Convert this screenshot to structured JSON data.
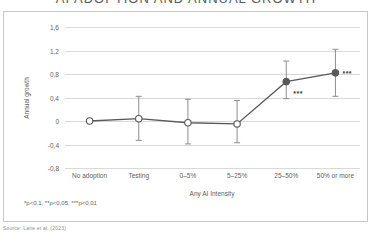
{
  "title": {
    "text": "AI ADOPTION AND ANNUAL GROWTH",
    "note": "cropped at top edge of screenshot"
  },
  "attribution": {
    "text": "Source: Lane et al. (2023)"
  },
  "footnote": {
    "text": "*p<0,1, **p<0,05, ***p<0,01"
  },
  "axes": {
    "ylabel": "Annual growth",
    "xlabel": "Any AI Intensity",
    "yticks": [
      "1,6",
      "1,2",
      "0,8",
      "0,4",
      "0",
      "-0,4",
      "-0,8"
    ]
  },
  "colors": {
    "line": "#595959",
    "marker_filled": "#595959",
    "marker_hollow": "#ffffff",
    "marker_stroke": "#595959",
    "errorbar": "#8c8c8c",
    "gridline": "#d9d9d9",
    "panel_border": "#c8c8c8",
    "text": "#5f5f5f",
    "background": "#ffffff"
  },
  "chart_data": {
    "type": "line",
    "title": "AI ADOPTION AND ANNUAL GROWTH",
    "xlabel": "Any AI Intensity",
    "ylabel": "Annual growth",
    "categories": [
      "No adoption",
      "Testing",
      "0–5%",
      "5–25%",
      "25–50%",
      "50% or more"
    ],
    "values": [
      0.0,
      0.04,
      -0.03,
      -0.05,
      0.67,
      0.82
    ],
    "error_low": [
      null,
      -0.33,
      -0.39,
      -0.37,
      0.38,
      0.42
    ],
    "error_high": [
      null,
      0.42,
      0.37,
      0.35,
      1.02,
      1.22
    ],
    "marker_filled": [
      false,
      false,
      false,
      false,
      true,
      true
    ],
    "significance": [
      "",
      "",
      "",
      "",
      "***",
      "***"
    ],
    "ylim": [
      -0.8,
      1.6
    ],
    "yticks": [
      1.6,
      1.2,
      0.8,
      0.4,
      0,
      -0.4,
      -0.8
    ],
    "grid": true,
    "legend": null
  }
}
